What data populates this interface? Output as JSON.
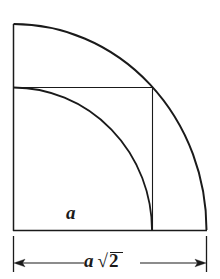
{
  "figure": {
    "stroke_color": "#1a1a1a",
    "background_color": "#ffffff",
    "labels": {
      "side_label": "a",
      "dimension_label_prefix": "a",
      "dimension_radical_symbol": "√",
      "dimension_radicand": "2",
      "dimension_label_full": "a √2"
    },
    "geometry": {
      "outer_square": {
        "left": 13,
        "top": 24,
        "right": 206,
        "bottom": 230,
        "note": "Left and bottom edges drawn; top edge drawn only as short segment at corner"
      },
      "inner_square": {
        "left": 13,
        "top": 87,
        "right": 152,
        "bottom": 230,
        "side_label": "a"
      },
      "large_arc": {
        "center_x": 13,
        "center_y": 230,
        "radius_x": 193,
        "radius_y": 206,
        "start": [
          13,
          24
        ],
        "end": [
          206,
          230
        ]
      },
      "small_arc": {
        "center_x": 13,
        "center_y": 230,
        "radius_x": 139,
        "radius_y": 143,
        "start": [
          13,
          87
        ],
        "end": [
          152,
          230
        ]
      },
      "dimension_line": {
        "y": 263,
        "left_x": 14,
        "right_x": 206,
        "extension_left_x": 13,
        "extension_right_x": 207,
        "extension_top": 234,
        "extension_bottom": 272,
        "arrow_left": "left-pointing",
        "arrow_right": "right-pointing"
      }
    }
  }
}
